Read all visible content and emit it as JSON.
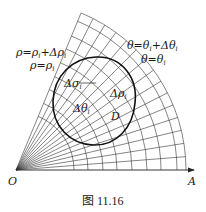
{
  "figure": {
    "caption": "图 11.16",
    "origin_label": "O",
    "axis_end_label": "A",
    "labels": {
      "rho_outer": "ρ=ρ",
      "rho_outer_sub": "i",
      "rho_outer_plus": "+Δρ",
      "rho_outer_plus_sub": "i",
      "rho_inner": "ρ=ρ",
      "rho_inner_sub": "i",
      "theta_outer": "θ=θ",
      "theta_outer_sub": "i",
      "theta_outer_plus": "+Δθ",
      "theta_outer_plus_sub": "i",
      "theta_inner": "θ=θ",
      "theta_inner_sub": "i",
      "delta_sigma": "Δσ",
      "delta_sigma_sub": "i",
      "delta_rho": "Δρ",
      "delta_rho_sub": "i",
      "delta_theta": "Δθ",
      "delta_theta_sub": "i",
      "region": "D"
    },
    "colors": {
      "line": "#222222",
      "background": "#ffffff"
    }
  }
}
